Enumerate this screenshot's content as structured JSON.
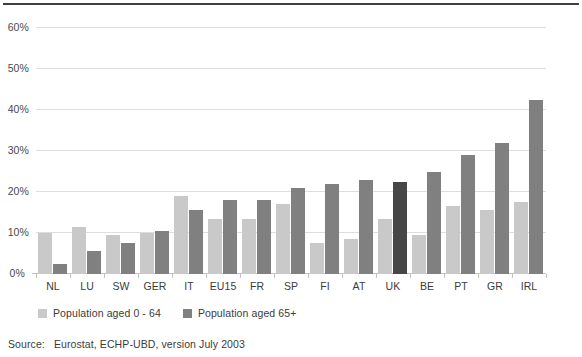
{
  "chart_data": {
    "type": "bar",
    "title": "",
    "subtitle": "",
    "xlabel": "",
    "ylabel": "",
    "ylim": [
      0,
      60
    ],
    "ytick_values": [
      0,
      10,
      20,
      30,
      40,
      50,
      60
    ],
    "ytick_labels": [
      "0%",
      "10%",
      "20%",
      "30%",
      "40%",
      "50%",
      "60%"
    ],
    "grid": "horizontal",
    "legend_position": "bottom-left",
    "categories": [
      "NL",
      "LU",
      "SW",
      "GER",
      "IT",
      "EU15",
      "FR",
      "SP",
      "FI",
      "AT",
      "UK",
      "BE",
      "PT",
      "GR",
      "IRL"
    ],
    "series": [
      {
        "name": "Population aged 0 - 64",
        "color": "#c9c9c9",
        "values": [
          10.0,
          11.5,
          9.5,
          10.0,
          19.0,
          13.5,
          13.5,
          17.0,
          7.5,
          8.5,
          13.5,
          9.5,
          16.5,
          15.5,
          17.5
        ]
      },
      {
        "name": "Population aged 65+",
        "color": "#808080",
        "highlight_color": "#464646",
        "highlight_category": "UK",
        "values": [
          2.5,
          5.5,
          7.5,
          10.5,
          15.5,
          18.0,
          18.0,
          21.0,
          22.0,
          23.0,
          22.5,
          25.0,
          29.0,
          32.0,
          42.5
        ]
      }
    ]
  },
  "legend": {
    "items": [
      {
        "label": "Population aged 0 - 64",
        "color": "#c9c9c9"
      },
      {
        "label": "Population aged 65+",
        "color": "#808080"
      }
    ]
  },
  "source": {
    "label": "Source:",
    "text": "Eurostat, ECHP-UBD, version July 2003"
  }
}
